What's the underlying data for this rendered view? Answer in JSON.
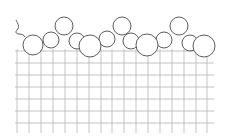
{
  "diagram": {
    "title": "",
    "colors": {
      "background": "#ffffff",
      "grid": "#b4b4b4",
      "circle_stroke": "#4a4a4a",
      "circle_fill": "#ffffff"
    },
    "grid": {
      "x_lines": [
        17,
        29,
        41,
        53,
        65,
        77,
        89,
        101,
        112,
        124,
        136,
        148,
        160,
        172,
        184,
        196,
        207
      ],
      "y_lines": [
        51,
        63,
        75,
        87,
        99,
        111,
        123
      ],
      "x_start": 15,
      "x_end": 214,
      "y_start": 49,
      "y_end": 133
    },
    "particles": [
      {
        "layer": "mid",
        "cx": 51,
        "cy": 40,
        "r": 8
      },
      {
        "layer": "mid",
        "cx": 77,
        "cy": 41,
        "r": 8
      },
      {
        "layer": "mid",
        "cx": 107,
        "cy": 39,
        "r": 8
      },
      {
        "layer": "mid",
        "cx": 131,
        "cy": 41,
        "r": 8
      },
      {
        "layer": "mid",
        "cx": 164,
        "cy": 40,
        "r": 8
      },
      {
        "layer": "mid",
        "cx": 190,
        "cy": 43,
        "r": 8
      },
      {
        "layer": "top",
        "cx": 64,
        "cy": 26,
        "r": 9
      },
      {
        "layer": "top",
        "cx": 122,
        "cy": 26,
        "r": 9
      },
      {
        "layer": "top",
        "cx": 179,
        "cy": 26,
        "r": 9
      },
      {
        "layer": "bottom",
        "cx": 33,
        "cy": 45,
        "r": 10
      },
      {
        "layer": "bottom",
        "cx": 90,
        "cy": 46,
        "r": 11
      },
      {
        "layer": "bottom",
        "cx": 147,
        "cy": 45,
        "r": 11
      },
      {
        "layer": "bottom",
        "cx": 204,
        "cy": 46,
        "r": 11
      }
    ],
    "left_squiggle": "M16 20 C18 24, 20 27, 17 30 C15 32, 16 34, 19 34 C22 34, 24 35, 25 37"
  }
}
